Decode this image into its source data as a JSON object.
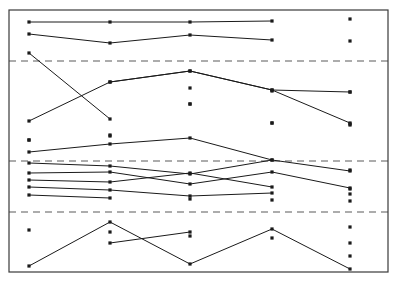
{
  "chart_data": {
    "type": "line",
    "title": "",
    "subtitle": "",
    "xlabel": "",
    "ylabel": "",
    "grid": true,
    "legend": false,
    "legend_position": "none",
    "background_color": "#ffffff",
    "frame": {
      "x": 9,
      "y": 10,
      "width": 379,
      "height": 262,
      "stroke": "#3a3a3a",
      "stroke_width": 1.2
    },
    "marker": {
      "shape": "square-dot",
      "size": 3.2,
      "color": "#1a1a1a"
    },
    "line": {
      "color": "#1a1a1a",
      "width": 1.0
    },
    "x": [
      1,
      2,
      3,
      4,
      5
    ],
    "x_pixels": [
      29,
      110,
      190,
      272,
      350
    ],
    "xlim": [
      9,
      388
    ],
    "ylim": [
      272,
      10
    ],
    "reference_lines": {
      "style": "dashed",
      "color": "#5a5a5a",
      "width": 1.1,
      "dash": "7,5",
      "y_pixels": [
        61,
        161,
        212
      ]
    },
    "series": [
      {
        "name": "series-1",
        "points": [
          [
            29,
            22
          ],
          [
            110,
            22
          ],
          [
            190,
            22
          ],
          [
            272,
            21
          ],
          [
            350,
            19
          ]
        ],
        "connected": [
          true,
          true,
          true,
          false
        ],
        "note": "flat top line; last point detached"
      },
      {
        "name": "series-2",
        "points": [
          [
            29,
            34
          ],
          [
            110,
            43
          ],
          [
            190,
            35
          ],
          [
            272,
            40
          ],
          [
            350,
            41
          ]
        ],
        "connected": [
          true,
          true,
          true,
          false
        ],
        "note": "second line; last point detached"
      },
      {
        "name": "series-3",
        "points": [
          [
            29,
            53
          ],
          [
            110,
            119
          ],
          [
            190,
            88
          ],
          [
            272,
            91
          ],
          [
            350,
            92
          ]
        ],
        "connected": [
          true,
          false,
          false,
          false
        ],
        "note": "steep descending segment from x1 to x2"
      },
      {
        "name": "series-4",
        "points": [
          [
            110,
            82
          ],
          [
            190,
            71
          ],
          [
            272,
            90
          ],
          [
            350,
            123
          ]
        ],
        "connected": [
          true,
          true,
          true
        ],
        "note": "rises then falls to right"
      },
      {
        "name": "series-5",
        "points": [
          [
            29,
            140
          ],
          [
            110,
            135
          ],
          [
            190,
            104
          ],
          [
            272,
            123
          ],
          [
            350,
            125
          ]
        ],
        "connected": [
          false,
          false,
          false,
          false
        ],
        "note": "isolated markers in left column"
      },
      {
        "name": "series-6",
        "points": [
          [
            29,
            121
          ],
          [
            110,
            82
          ],
          [
            190,
            71
          ],
          [
            272,
            90
          ],
          [
            350,
            92
          ]
        ],
        "connected": [
          true,
          true,
          true,
          true
        ],
        "note": "ascends from bottom left to peak"
      },
      {
        "name": "series-7",
        "points": [
          [
            29,
            140
          ],
          [
            110,
            136
          ],
          [
            190,
            104
          ],
          [
            272,
            123
          ],
          [
            350,
            124
          ]
        ],
        "connected": [
          false,
          false,
          false,
          false
        ],
        "note": "left column isolated dots"
      },
      {
        "name": "series-8",
        "points": [
          [
            29,
            152
          ],
          [
            110,
            144
          ],
          [
            190,
            138
          ],
          [
            272,
            160
          ],
          [
            350,
            170
          ]
        ],
        "connected": [
          true,
          true,
          true,
          false
        ],
        "note": "gentle arc through middle"
      },
      {
        "name": "series-9",
        "points": [
          [
            29,
            163
          ],
          [
            110,
            166
          ],
          [
            190,
            174
          ],
          [
            272,
            160
          ],
          [
            350,
            171
          ]
        ],
        "connected": [
          true,
          true,
          true,
          true
        ],
        "note": "dense middle band line"
      },
      {
        "name": "series-10",
        "points": [
          [
            29,
            173
          ],
          [
            110,
            172
          ],
          [
            190,
            184
          ],
          [
            272,
            172
          ],
          [
            350,
            188
          ]
        ],
        "connected": [
          true,
          true,
          true,
          true
        ],
        "note": "dense middle band line"
      },
      {
        "name": "series-11",
        "points": [
          [
            29,
            180
          ],
          [
            110,
            182
          ],
          [
            190,
            173
          ],
          [
            272,
            187
          ],
          [
            350,
            189
          ]
        ],
        "connected": [
          true,
          true,
          true,
          false
        ],
        "note": "dense middle band line"
      },
      {
        "name": "series-12",
        "points": [
          [
            29,
            187
          ],
          [
            110,
            190
          ],
          [
            190,
            196
          ],
          [
            272,
            193
          ],
          [
            350,
            194
          ]
        ],
        "connected": [
          true,
          true,
          true,
          false
        ],
        "note": "dense middle band line"
      },
      {
        "name": "series-13",
        "points": [
          [
            29,
            195
          ],
          [
            110,
            198
          ],
          [
            190,
            199
          ],
          [
            272,
            200
          ],
          [
            350,
            201
          ]
        ],
        "connected": [
          true,
          false,
          false,
          false
        ],
        "note": "short segment at band bottom"
      },
      {
        "name": "series-14",
        "points": [
          [
            29,
            230
          ],
          [
            110,
            232
          ],
          [
            190,
            236
          ],
          [
            272,
            238
          ],
          [
            350,
            227
          ]
        ],
        "connected": [
          false,
          false,
          false,
          false
        ],
        "note": "isolated markers in lower band"
      },
      {
        "name": "series-15",
        "points": [
          [
            29,
            266
          ],
          [
            110,
            222
          ],
          [
            190,
            264
          ],
          [
            272,
            229
          ],
          [
            350,
            269
          ]
        ],
        "connected": [
          true,
          true,
          true,
          true
        ],
        "note": "zig-zag in bottom band"
      },
      {
        "name": "series-16",
        "points": [
          [
            110,
            243
          ],
          [
            190,
            232
          ]
        ],
        "connected": [
          true
        ],
        "note": "short rising segment in bottom band"
      },
      {
        "name": "series-17",
        "points": [
          [
            350,
            243
          ],
          [
            350,
            256
          ]
        ],
        "connected": [
          false
        ],
        "note": "detached right-edge markers in bottom band"
      }
    ]
  }
}
